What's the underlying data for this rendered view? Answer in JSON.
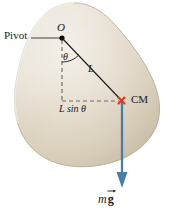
{
  "figure": {
    "kind": "physics-free-body-diagram",
    "background_color": "#ffffff",
    "body": {
      "name": "rigid-body-blob",
      "fill_light": "#efe9dd",
      "fill_mid": "#ded5c2",
      "fill_dark": "#c9bfa8",
      "edge_color": "#b8ad95"
    },
    "labels": {
      "pivot": "Pivot",
      "origin": "O",
      "theta": "θ",
      "length": "L",
      "moment_arm": "L sin θ",
      "center_of_mass": "CM",
      "weight_m": "m",
      "weight_g": "g"
    },
    "colors": {
      "line": "#1a1a1a",
      "dashed": "#7a7a7a",
      "cm_marker": "#e03a1e",
      "force_vector": "#4a7ca4",
      "text": "#1a1a1a"
    },
    "geometry": {
      "pivot_point": [
        62,
        37
      ],
      "cm_point": [
        122,
        101
      ],
      "vector_tip": [
        122,
        186
      ],
      "dashed_vertical_end": [
        62,
        103
      ]
    }
  }
}
